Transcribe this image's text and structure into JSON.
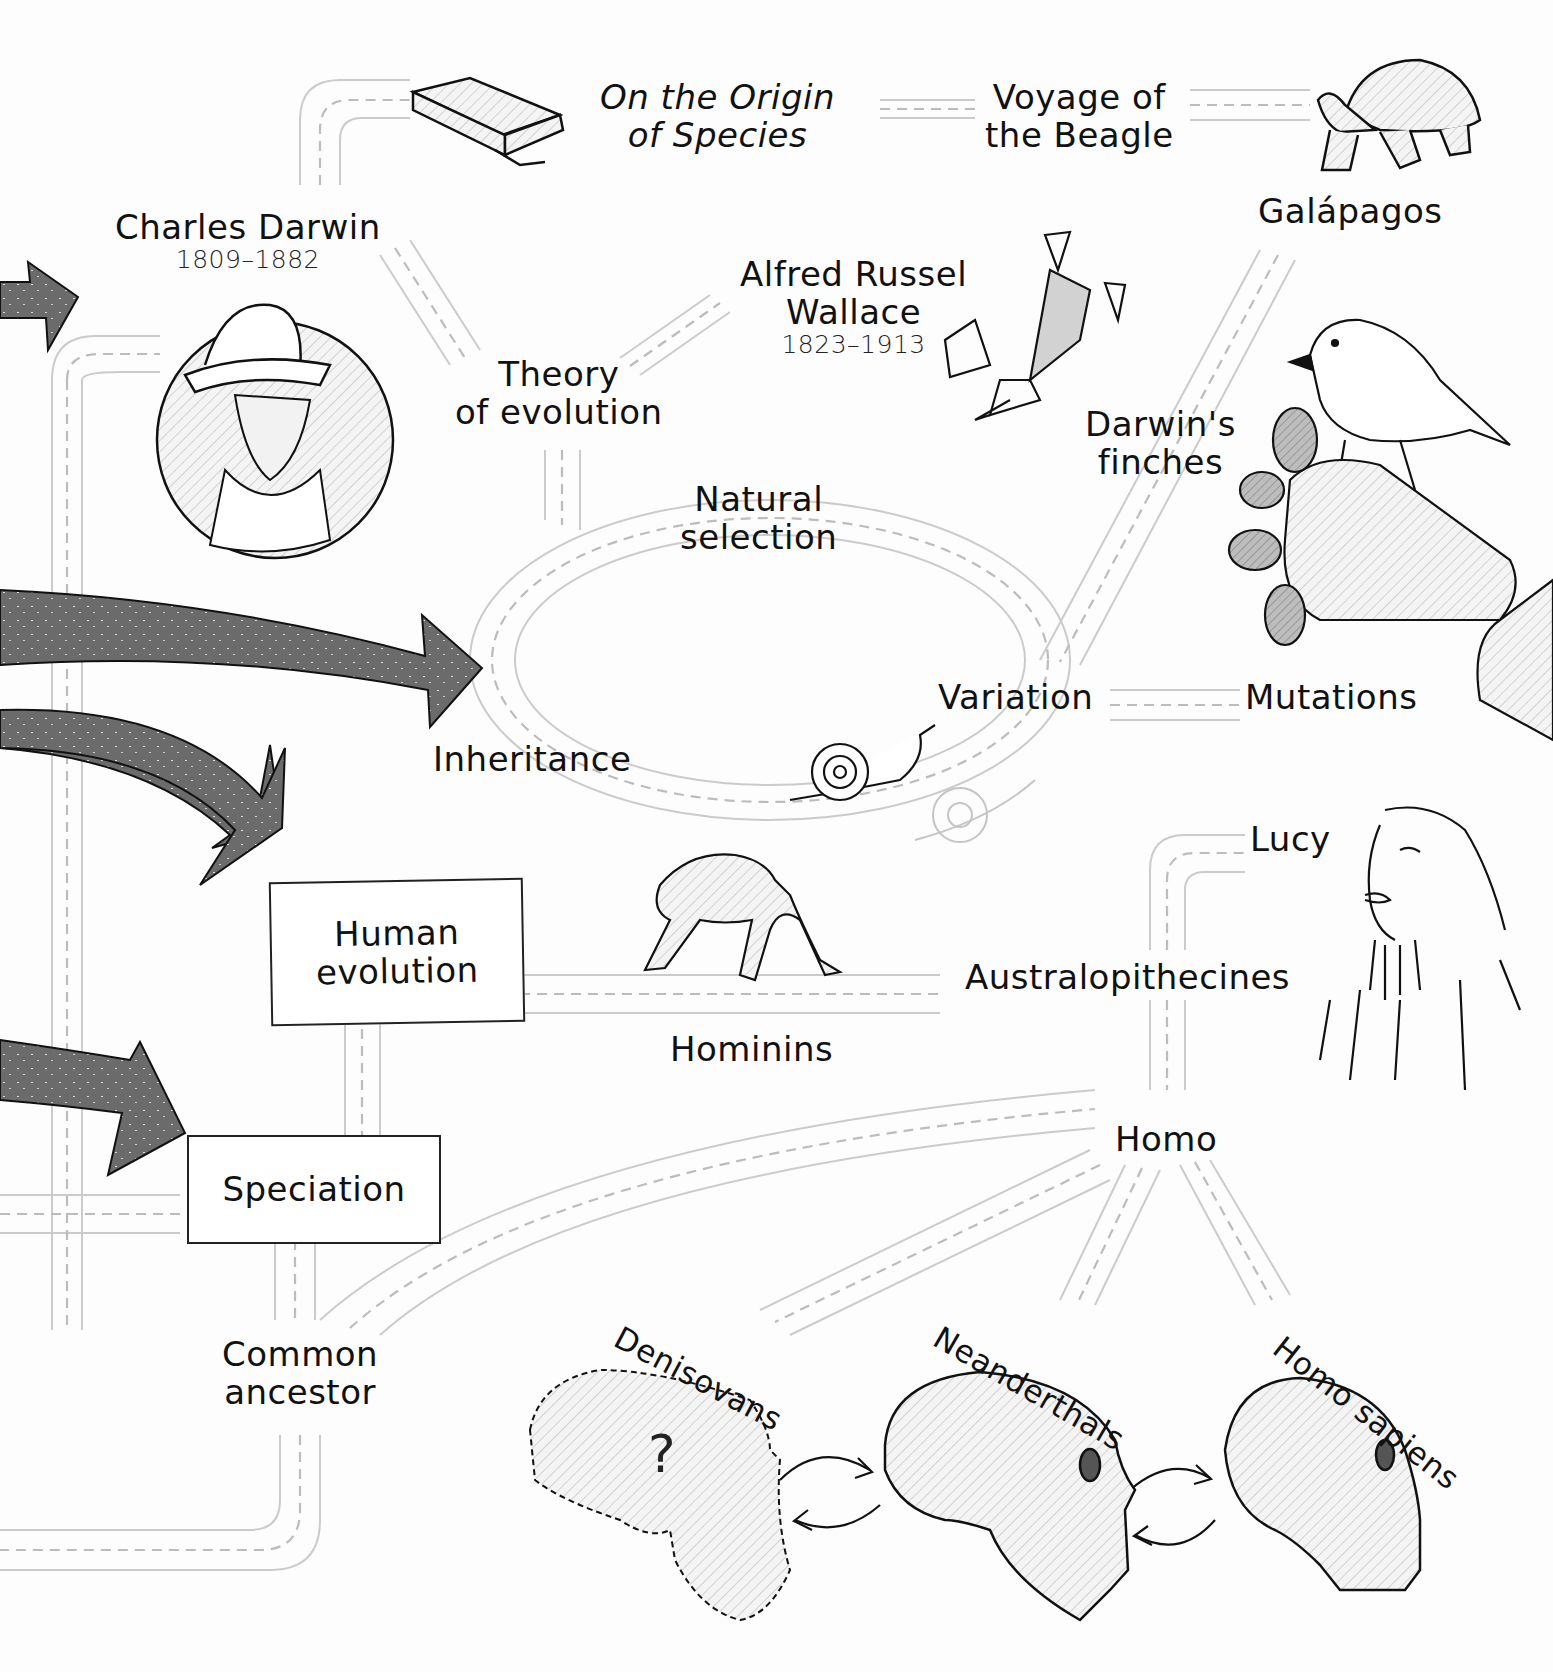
{
  "colors": {
    "road_edge": "#c9c9c9",
    "road_dash": "#bdbdbd",
    "arrow_fill": "#6b6b6b",
    "ink": "#111111",
    "hatch": "#d8d8d8"
  },
  "nodes": {
    "origin_of_species": {
      "line1": "On the Origin",
      "line2": "of Species"
    },
    "voyage_beagle": {
      "line1": "Voyage of",
      "line2": "the Beagle"
    },
    "galapagos": {
      "label": "Galápagos"
    },
    "charles_darwin": {
      "name": "Charles Darwin",
      "years": "1809–1882"
    },
    "wallace": {
      "line1": "Alfred Russel",
      "line2": "Wallace",
      "years": "1823–1913"
    },
    "theory_of_evolution": {
      "line1": "Theory",
      "line2": "of evolution"
    },
    "darwins_finches": {
      "line1": "Darwin's",
      "line2": "finches"
    },
    "natural_selection": {
      "line1": "Natural",
      "line2": "selection"
    },
    "variation": {
      "label": "Variation"
    },
    "mutations": {
      "label": "Mutations"
    },
    "inheritance": {
      "label": "Inheritance"
    },
    "human_evolution": {
      "line1": "Human",
      "line2": "evolution"
    },
    "speciation": {
      "label": "Speciation"
    },
    "lucy": {
      "label": "Lucy"
    },
    "australopithecines": {
      "label": "Australopithecines"
    },
    "hominins": {
      "label": "Hominins"
    },
    "homo": {
      "label": "Homo"
    },
    "common_ancestor": {
      "line1": "Common",
      "line2": "ancestor"
    },
    "denisovans": {
      "label": "Denisovans"
    },
    "neanderthals": {
      "label": "Neanderthals"
    },
    "homo_sapiens": {
      "label": "Homo sapiens"
    }
  },
  "illustrations": [
    "book-icon",
    "tortoise-icon",
    "darwin-portrait",
    "flying-frog-icon",
    "finch-icon",
    "cactus-icon",
    "snail-icon",
    "chimpanzee-icon",
    "lucy-portrait",
    "denisovan-skull-outline",
    "neanderthal-skull",
    "homo-sapiens-skull"
  ],
  "denisovan_mark": "?"
}
